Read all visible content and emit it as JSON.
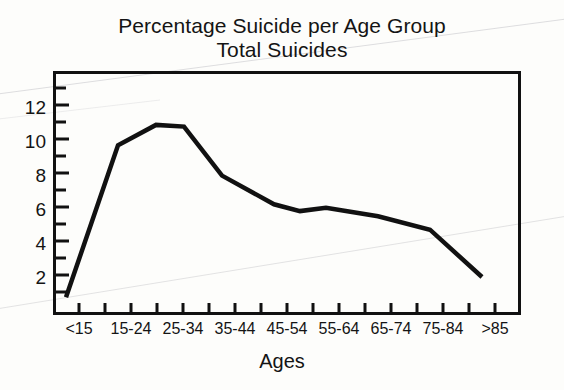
{
  "figure": {
    "title_lines": [
      "Percentage Suicide per Age Group",
      "Total Suicides"
    ],
    "background_color": "#fdfdfb",
    "line_color": "#111111",
    "axis_color": "#111111"
  },
  "chart_data": {
    "type": "line",
    "title": "Percentage Suicide per Age Group\nTotal Suicides",
    "title_line_1": "Percentage Suicide per Age Group",
    "title_line_2": "Total Suicides",
    "xlabel": "Ages",
    "ylabel": "",
    "categories": [
      "<15",
      "15-24",
      "25-34",
      "35-44",
      "45-54",
      "55-64",
      "65-74",
      "75-84",
      ">85"
    ],
    "values": [
      0.8,
      9.8,
      11.0,
      8.0,
      6.3,
      6.1,
      5.6,
      4.8,
      2.0
    ],
    "series": [
      {
        "name": "Total Suicides",
        "values": [
          0.8,
          9.8,
          11.0,
          8.0,
          6.3,
          6.1,
          5.6,
          4.8,
          2.0
        ]
      }
    ],
    "vertices": [
      {
        "category": "<15",
        "value": 0.8
      },
      {
        "category": "15-24",
        "value": 9.8
      },
      {
        "category": "25-34",
        "value": 11.0
      },
      {
        "category": "25-34-plateau",
        "value": 10.9
      },
      {
        "category": "35-44",
        "value": 8.0
      },
      {
        "category": "45-54",
        "value": 6.3
      },
      {
        "category": "45-54-dip",
        "value": 5.9
      },
      {
        "category": "55-64",
        "value": 6.1
      },
      {
        "category": "65-74",
        "value": 5.6
      },
      {
        "category": "75-84",
        "value": 4.8
      },
      {
        ">85": ">85",
        "value": 2.0
      }
    ],
    "ylim": [
      0,
      13.5
    ],
    "xlim": [
      0,
      9
    ],
    "ytick_labels": [
      "2",
      "4",
      "6",
      "8",
      "10",
      "12"
    ],
    "ytick_values": [
      2,
      4,
      6,
      8,
      10,
      12
    ],
    "yminor_tick_values": [
      1,
      3,
      5,
      7,
      9,
      11,
      13
    ],
    "grid": false,
    "legend": false,
    "legend_position": "none",
    "marker": "none",
    "linewidth_px": 4
  },
  "yticks": [
    {
      "label": "12",
      "value": 12
    },
    {
      "label": "10",
      "value": 10
    },
    {
      "label": "8",
      "value": 8
    },
    {
      "label": "6",
      "value": 6
    },
    {
      "label": "4",
      "value": 4
    },
    {
      "label": "2",
      "value": 2
    }
  ],
  "xticks": [
    {
      "label": "<15"
    },
    {
      "label": "15-24"
    },
    {
      "label": "25-34"
    },
    {
      "label": "35-44"
    },
    {
      "label": "45-54"
    },
    {
      "label": "55-64"
    },
    {
      "label": "65-74"
    },
    {
      "label": "75-84"
    },
    {
      "label": ">85"
    }
  ],
  "axis_title": {
    "x": "Ages"
  }
}
